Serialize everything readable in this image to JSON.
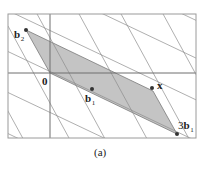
{
  "figure": {
    "caption": "(a)",
    "colors": {
      "frame": "#9a9a9a",
      "axis": "#6e6e6e",
      "lattice_line": "#8c8c8c",
      "parallelogram_fill": "#c4c4c4",
      "parallelogram_stroke": "#7a7a7a",
      "point": "#333333",
      "text": "#222222"
    },
    "labels": {
      "origin": "0",
      "b2": {
        "main": "b",
        "sub": "2"
      },
      "b1": {
        "main": "b",
        "sub": "1"
      },
      "x": "x",
      "three_b1": {
        "prefix": "3",
        "main": "b",
        "sub": "1"
      }
    },
    "points": {
      "origin": [
        50,
        73
      ],
      "b2": [
        26,
        30
      ],
      "b1": [
        92,
        89
      ],
      "x": [
        152,
        88
      ],
      "three_b1": [
        177,
        134
      ]
    }
  }
}
